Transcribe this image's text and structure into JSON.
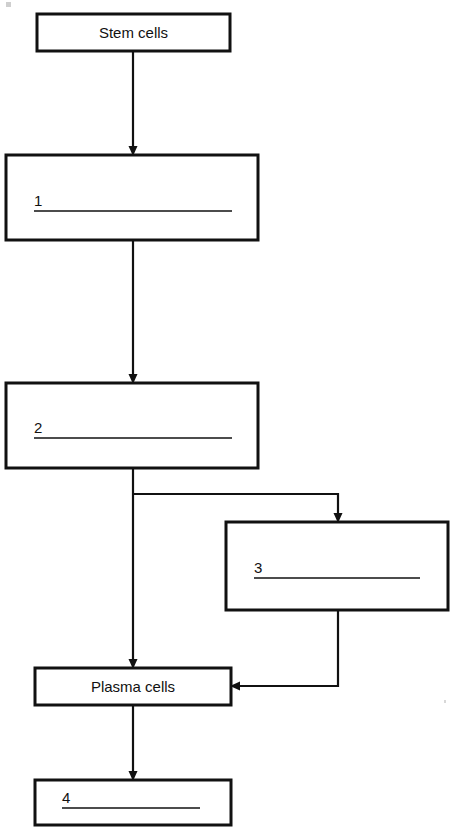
{
  "diagram": {
    "stroke_color": "#111111",
    "background_color": "#ffffff",
    "nodes": [
      {
        "id": "stem-cells",
        "label": "Stem cells",
        "kind": "labelled",
        "x": 37,
        "y": 14,
        "w": 193,
        "h": 37
      },
      {
        "id": "blank-1",
        "label": "1",
        "kind": "blank",
        "x": 6,
        "y": 155,
        "w": 252,
        "h": 85,
        "number_x": 34,
        "number_y": 206,
        "rule_x1": 42,
        "rule_x2": 232,
        "rule_y": 211
      },
      {
        "id": "blank-2",
        "label": "2",
        "kind": "blank",
        "x": 6,
        "y": 383,
        "w": 252,
        "h": 85,
        "number_x": 34,
        "number_y": 433,
        "rule_x1": 42,
        "rule_x2": 232,
        "rule_y": 438
      },
      {
        "id": "blank-3",
        "label": "3",
        "kind": "blank",
        "x": 226,
        "y": 522,
        "w": 222,
        "h": 88,
        "number_x": 254,
        "number_y": 573,
        "rule_x1": 262,
        "rule_x2": 420,
        "rule_y": 578
      },
      {
        "id": "plasma-cells",
        "label": "Plasma cells",
        "kind": "labelled",
        "x": 35,
        "y": 668,
        "w": 196,
        "h": 37
      },
      {
        "id": "blank-4",
        "label": "4",
        "kind": "blank",
        "x": 35,
        "y": 780,
        "w": 196,
        "h": 45,
        "number_x": 62,
        "number_y": 803,
        "rule_x1": 70,
        "rule_x2": 200,
        "rule_y": 808
      }
    ],
    "connectors": [
      {
        "id": "stem-to-1",
        "from": "stem-cells",
        "to": "blank-1",
        "path": "M 133,51 L 133,150",
        "arrow": {
          "x": 133,
          "y": 155,
          "dir": "down"
        }
      },
      {
        "id": "one-to-2",
        "from": "blank-1",
        "to": "blank-2",
        "path": "M 133,240 L 133,378",
        "arrow": {
          "x": 133,
          "y": 383,
          "dir": "down"
        }
      },
      {
        "id": "two-to-plasma",
        "from": "blank-2",
        "to": "plasma-cells",
        "path": "M 133,468 L 133,663",
        "arrow": {
          "x": 133,
          "y": 668,
          "dir": "down"
        }
      },
      {
        "id": "two-to-3",
        "from": "blank-2",
        "to": "blank-3",
        "path": "M 134,494 L 338,494 L 338,517",
        "arrow": {
          "x": 338,
          "y": 522,
          "dir": "down"
        }
      },
      {
        "id": "three-to-plasma",
        "from": "blank-3",
        "to": "plasma-cells",
        "path": "M 338,610 L 338,686 L 236,686",
        "arrow": {
          "x": 231,
          "y": 686,
          "dir": "left"
        }
      },
      {
        "id": "plasma-to-4",
        "from": "plasma-cells",
        "to": "blank-4",
        "path": "M 133,705 L 133,775",
        "arrow": {
          "x": 133,
          "y": 780,
          "dir": "down"
        }
      }
    ],
    "artifacts": [
      {
        "id": "corner-mark",
        "x": 6,
        "y": 2,
        "w": 5,
        "h": 5
      },
      {
        "id": "right-speck",
        "x": 444,
        "y": 700,
        "w": 2,
        "h": 3
      }
    ]
  }
}
